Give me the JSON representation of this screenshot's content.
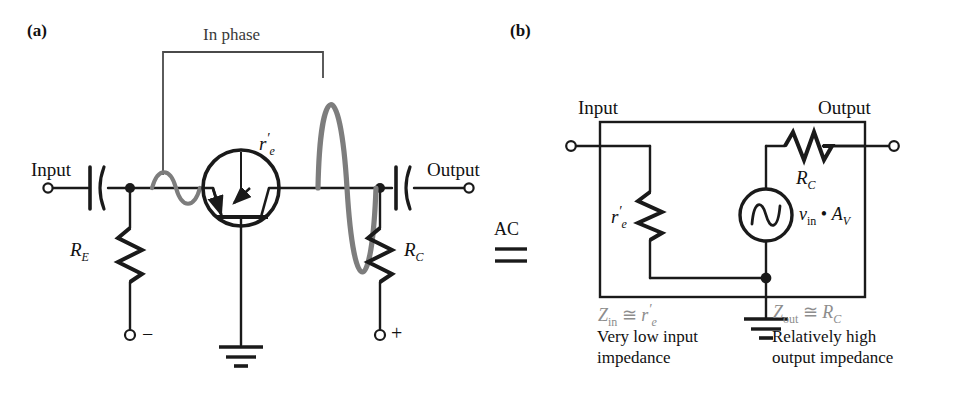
{
  "figure": {
    "type": "schematic-diagram",
    "colors": {
      "wire": "#1a1a1a",
      "waveform": "#7d7d7d",
      "gray_text": "#8d8d8d",
      "background": "#ffffff"
    }
  },
  "panel_a": {
    "tag": "(a)",
    "phase_note": "In phase",
    "input_terminal_label": "Input",
    "output_terminal_label": "Output",
    "transistor_param": "r",
    "transistor_param_prime": "′",
    "transistor_param_sub": "e",
    "emitter_resistor": "R",
    "emitter_resistor_sub": "E",
    "collector_resistor": "R",
    "collector_resistor_sub": "C",
    "bias_minus": "−",
    "bias_plus": "+",
    "input_waveform": {
      "style": "small sine, gray, in phase with output",
      "cycles": 1,
      "amplitude_px": 14
    },
    "output_waveform": {
      "style": "large sine, gray, in phase with input",
      "cycles": 1,
      "amplitude_px": 118
    }
  },
  "equivalence": {
    "label": "AC",
    "symbol": "≡"
  },
  "panel_b": {
    "tag": "(b)",
    "input_terminal_label": "Input",
    "output_terminal_label": "Output",
    "shunt_resistor": "r",
    "shunt_resistor_prime": "′",
    "shunt_resistor_sub": "e",
    "series_resistor": "R",
    "series_resistor_sub": "C",
    "source_label_v": "v",
    "source_label_v_sub": "in",
    "source_label_dot": "•",
    "source_label_a": "A",
    "source_label_a_sub": "V",
    "z_in": {
      "symbol": "Z",
      "sub": "in",
      "relation": "≅",
      "value": "r",
      "value_prime": "′",
      "value_sub": "e"
    },
    "z_out": {
      "symbol": "Z",
      "sub": "out",
      "relation": "≅",
      "value": "R",
      "value_sub": "C"
    },
    "input_note_line1": "Very low input",
    "input_note_line2": "impedance",
    "output_note_line1": "Relatively high",
    "output_note_line2": "output impedance"
  }
}
